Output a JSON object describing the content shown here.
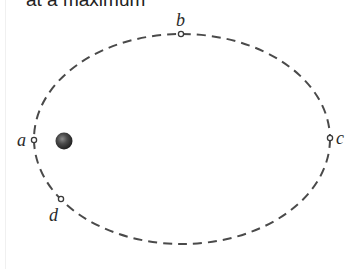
{
  "caption": {
    "text": "at a maximum"
  },
  "diagram": {
    "type": "elliptical-orbit",
    "orbit": {
      "style": "dashed",
      "color": "#4a4a4a"
    },
    "body": {
      "name": "planet",
      "color": "#3a3a3a"
    },
    "points": [
      {
        "id": "a",
        "label": "a"
      },
      {
        "id": "b",
        "label": "b"
      },
      {
        "id": "c",
        "label": "c"
      },
      {
        "id": "d",
        "label": "d"
      }
    ]
  }
}
